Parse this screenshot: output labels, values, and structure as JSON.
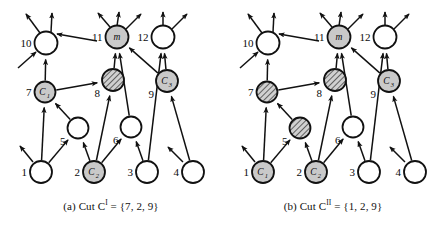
{
  "figure": {
    "width": 445,
    "height": 226,
    "style": {
      "plain_fill": "#ffffff",
      "gray_fill": "#c9c9c9",
      "hatch_fill": "#d0d0d0",
      "stroke": "#111111",
      "text": "#0b0b0b"
    }
  },
  "panels": [
    {
      "id": "a",
      "caption_prefix": "(a) Cut C",
      "caption_sup": "I",
      "caption_suffix": " = {7, 2, 9}",
      "caption_full": "(a) Cut Cᴵ = {7, 2, 9}",
      "cut_set": [
        7,
        2,
        9
      ],
      "nodes": [
        {
          "id": "10",
          "label": "10",
          "inner": "",
          "inner_sub": "",
          "x": 46,
          "y": 43,
          "r": 11.5,
          "fill": "plain",
          "label_pos": "left"
        },
        {
          "id": "m",
          "label": "11",
          "inner": "m",
          "inner_sub": "",
          "x": 117,
          "y": 37,
          "r": 11.5,
          "fill": "gray",
          "label_pos": "left"
        },
        {
          "id": "12",
          "label": "12",
          "inner": "",
          "inner_sub": "",
          "x": 163,
          "y": 37,
          "r": 11.5,
          "fill": "plain",
          "label_pos": "left"
        },
        {
          "id": "7",
          "label": "7",
          "inner": "C",
          "inner_sub": "1",
          "x": 45,
          "y": 92,
          "r": 10.5,
          "fill": "gray",
          "label_pos": "left"
        },
        {
          "id": "8",
          "label": "8",
          "inner": "",
          "inner_sub": "",
          "x": 113,
          "y": 80,
          "r": 11,
          "fill": "hatch",
          "label_pos": "belowleft"
        },
        {
          "id": "9",
          "label": "9",
          "inner": "C",
          "inner_sub": "3",
          "x": 167,
          "y": 81,
          "r": 11,
          "fill": "gray",
          "label_pos": "belowleft"
        },
        {
          "id": "5",
          "label": "5",
          "inner": "",
          "inner_sub": "",
          "x": 78,
          "y": 128,
          "r": 10.5,
          "fill": "plain",
          "label_pos": "belowleft"
        },
        {
          "id": "6",
          "label": "6",
          "inner": "",
          "inner_sub": "",
          "x": 131,
          "y": 127,
          "r": 10.5,
          "fill": "plain",
          "label_pos": "belowleft"
        },
        {
          "id": "1",
          "label": "1",
          "inner": "",
          "inner_sub": "",
          "x": 41,
          "y": 172,
          "r": 11,
          "fill": "plain",
          "label_pos": "left"
        },
        {
          "id": "2",
          "label": "2",
          "inner": "C",
          "inner_sub": "2",
          "x": 94,
          "y": 172,
          "r": 11,
          "fill": "gray",
          "label_pos": "left"
        },
        {
          "id": "3",
          "label": "3",
          "inner": "",
          "inner_sub": "",
          "x": 147,
          "y": 172,
          "r": 11,
          "fill": "plain",
          "label_pos": "left"
        },
        {
          "id": "4",
          "label": "4",
          "inner": "",
          "inner_sub": "",
          "x": 193,
          "y": 172,
          "r": 11,
          "fill": "plain",
          "label_pos": "left"
        }
      ]
    },
    {
      "id": "b",
      "caption_prefix": "(b) Cut C",
      "caption_sup": "II",
      "caption_suffix": " = {1, 2, 9}",
      "caption_full": "(b) Cut Cᴵᴵ = {1, 2, 9}",
      "cut_set": [
        1,
        2,
        9
      ],
      "nodes": [
        {
          "id": "10",
          "label": "10",
          "inner": "",
          "inner_sub": "",
          "x": 46,
          "y": 43,
          "r": 11.5,
          "fill": "plain",
          "label_pos": "left"
        },
        {
          "id": "m",
          "label": "11",
          "inner": "m",
          "inner_sub": "",
          "x": 117,
          "y": 37,
          "r": 11.5,
          "fill": "gray",
          "label_pos": "left"
        },
        {
          "id": "12",
          "label": "12",
          "inner": "",
          "inner_sub": "",
          "x": 163,
          "y": 37,
          "r": 11.5,
          "fill": "plain",
          "label_pos": "left"
        },
        {
          "id": "7",
          "label": "7",
          "inner": "",
          "inner_sub": "",
          "x": 45,
          "y": 92,
          "r": 10.5,
          "fill": "hatch",
          "label_pos": "left"
        },
        {
          "id": "8",
          "label": "8",
          "inner": "",
          "inner_sub": "",
          "x": 113,
          "y": 80,
          "r": 11,
          "fill": "hatch",
          "label_pos": "belowleft"
        },
        {
          "id": "9",
          "label": "9",
          "inner": "C",
          "inner_sub": "3",
          "x": 167,
          "y": 81,
          "r": 11,
          "fill": "gray",
          "label_pos": "belowleft"
        },
        {
          "id": "5",
          "label": "5",
          "inner": "",
          "inner_sub": "",
          "x": 78,
          "y": 128,
          "r": 10.5,
          "fill": "hatch",
          "label_pos": "belowleft"
        },
        {
          "id": "6",
          "label": "6",
          "inner": "",
          "inner_sub": "",
          "x": 131,
          "y": 127,
          "r": 10.5,
          "fill": "plain",
          "label_pos": "belowleft"
        },
        {
          "id": "1",
          "label": "1",
          "inner": "C",
          "inner_sub": "1",
          "x": 41,
          "y": 172,
          "r": 11,
          "fill": "gray",
          "label_pos": "left"
        },
        {
          "id": "2",
          "label": "2",
          "inner": "C",
          "inner_sub": "2",
          "x": 94,
          "y": 172,
          "r": 11,
          "fill": "gray",
          "label_pos": "left"
        },
        {
          "id": "3",
          "label": "3",
          "inner": "",
          "inner_sub": "",
          "x": 147,
          "y": 172,
          "r": 11,
          "fill": "plain",
          "label_pos": "left"
        },
        {
          "id": "4",
          "label": "4",
          "inner": "",
          "inner_sub": "",
          "x": 193,
          "y": 172,
          "r": 11,
          "fill": "plain",
          "label_pos": "left"
        }
      ]
    }
  ],
  "edges": [
    {
      "from": "1",
      "to": "7"
    },
    {
      "from": "1",
      "to": "5"
    },
    {
      "from": "2",
      "to": "5"
    },
    {
      "from": "2",
      "to": "6"
    },
    {
      "from": "2",
      "to": "8"
    },
    {
      "from": "3",
      "to": "6"
    },
    {
      "from": "3",
      "to": "12"
    },
    {
      "from": "4",
      "to": "9"
    },
    {
      "from": "5",
      "to": "7"
    },
    {
      "from": "6",
      "to": "m"
    },
    {
      "from": "7",
      "to": "10"
    },
    {
      "from": "7",
      "to": "8"
    },
    {
      "from": "8",
      "to": "m"
    },
    {
      "from": "9",
      "to": "m"
    },
    {
      "from": "9",
      "to": "12"
    }
  ],
  "free_edges": [
    {
      "panel_rel": "into-10",
      "from": [
        18,
        68
      ],
      "to": [
        36,
        52
      ]
    },
    {
      "panel_rel": "out-10-left",
      "from": [
        40,
        33
      ],
      "to": [
        26,
        14
      ]
    },
    {
      "panel_rel": "out-10-right",
      "from": [
        51,
        32
      ],
      "to": [
        52,
        13
      ]
    },
    {
      "panel_rel": "into-10-upright",
      "from": [
        97,
        41
      ],
      "to": [
        57,
        34
      ]
    },
    {
      "panel_rel": "out-m-left",
      "from": [
        110,
        27
      ],
      "to": [
        98,
        13
      ]
    },
    {
      "panel_rel": "out-m-up",
      "from": [
        117,
        26
      ],
      "to": [
        119,
        12
      ]
    },
    {
      "panel_rel": "out-m-right",
      "from": [
        126,
        29
      ],
      "to": [
        141,
        14
      ]
    },
    {
      "panel_rel": "out-12-up",
      "from": [
        163,
        26
      ],
      "to": [
        163,
        12
      ]
    },
    {
      "panel_rel": "out-12-right",
      "from": [
        172,
        29
      ],
      "to": [
        187,
        14
      ]
    },
    {
      "panel_rel": "out-1-upleft",
      "from": [
        33,
        162
      ],
      "to": [
        20,
        146
      ]
    },
    {
      "panel_rel": "into-4-upleft",
      "from": [
        183,
        162
      ],
      "to": [
        168,
        147
      ]
    }
  ]
}
